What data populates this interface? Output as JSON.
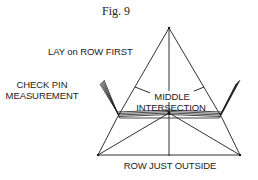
{
  "figure": {
    "caption": "Fig. 9",
    "labels": {
      "lay_on_row_first": "LAY on ROW FIRST",
      "check_pin_line1": "CHECK PIN",
      "check_pin_line2": "MEASUREMENT",
      "middle": "MIDDLE",
      "intersection": "INTERSECTION",
      "row_just_outside": "ROW JUST OUTSIDE"
    },
    "colors": {
      "line": "#1a1a1a",
      "background": "#ffffff"
    }
  }
}
